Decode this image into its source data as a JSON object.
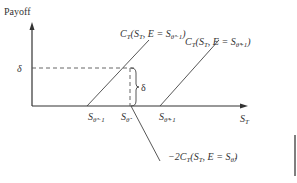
{
  "diagram": {
    "y_axis_label": "Payoff",
    "x_axis_label": {
      "base": "S",
      "sub": "T"
    },
    "delta_label": "δ",
    "brace_label": "δ",
    "strikes": [
      {
        "base": "S",
        "sub": "θ̂−1"
      },
      {
        "base": "S",
        "sub": "θ̂"
      },
      {
        "base": "S",
        "sub": "θ̂+1"
      }
    ],
    "curves": [
      {
        "name": "long call lower strike",
        "label_pre": "C",
        "label_sub": "T",
        "label_mid": "(S",
        "label_mid_sub": "T",
        "label_post": ", E = S",
        "label_strike_sub": "θ̂−1",
        "label_end": ")"
      },
      {
        "name": "long call upper strike",
        "label_pre": "C",
        "label_sub": "T",
        "label_mid": "(S",
        "label_mid_sub": "T",
        "label_post": ", E = S",
        "label_strike_sub": "θ̂+1",
        "label_end": ")"
      },
      {
        "name": "short two calls middle strike",
        "label_pre": "−2C",
        "label_sub": "T",
        "label_mid": "(S",
        "label_mid_sub": "T",
        "label_post": ", E = S",
        "label_strike_sub": "θ̂",
        "label_end": ")"
      }
    ],
    "colors": {
      "ink": "#333333",
      "line": "#444444",
      "background": "#ffffff"
    }
  }
}
